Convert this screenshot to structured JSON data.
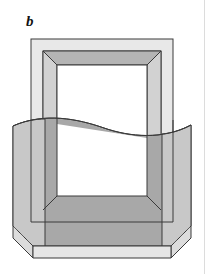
{
  "figure": {
    "panel_label": "b",
    "kind": "technical-line-illustration",
    "caption_text": "",
    "colors": {
      "background": "#ffffff",
      "outline": "#3a3a3a",
      "frame_face_light": "#e8e8e8",
      "frame_bevel_mid": "#d2d2d2",
      "frame_bevel_dark": "#b4b4b4",
      "body_dark": "#a8a8a8",
      "body_side_mid": "#c4c4c4",
      "body_side_light": "#dcdcdc",
      "opening_white": "#ffffff",
      "page_edge_rule": "#dcdcdc",
      "label_color": "#111111"
    },
    "geometry": {
      "outer_frame": {
        "x": 31,
        "y": 39,
        "width": 142,
        "height": 183
      },
      "inner_bevel": {
        "x": 43,
        "y": 51,
        "width": 118,
        "height": 159
      },
      "opening": {
        "x": 57,
        "y": 65,
        "width": 90,
        "height": 131
      },
      "body_left_edge_x": 13,
      "body_right_edge_x": 191,
      "body_bottom_y": 246,
      "chamfer_size": 20,
      "wave_baseline_y": 122,
      "wave_amplitude_px": 9
    },
    "line_styles": {
      "solid_outline_width_px": 1,
      "hidden_edge_style": "dashed",
      "hidden_edge_dash": "5 4"
    },
    "elements": [
      {
        "name": "outer-frame-face",
        "fill": "#e8e8e8"
      },
      {
        "name": "top-bevel-dark",
        "fill": "#b4b4b4"
      },
      {
        "name": "left-bevel",
        "fill": "#d2d2d2"
      },
      {
        "name": "right-bevel",
        "fill": "#d2d2d2"
      },
      {
        "name": "bottom-bevel",
        "fill": "#e2e2e2"
      },
      {
        "name": "extruded-body",
        "fill": "#a8a8a8"
      },
      {
        "name": "body-left-side",
        "fill": "#c4c4c4"
      },
      {
        "name": "body-right-side",
        "fill": "#c4c4c4"
      },
      {
        "name": "bottom-chamfer-left",
        "fill": "#dcdcdc"
      },
      {
        "name": "bottom-chamfer-right",
        "fill": "#dcdcdc"
      },
      {
        "name": "section-wave-curve",
        "stroke": "#3a3a3a"
      },
      {
        "name": "hidden-edge-left",
        "stroke": "#6a6a6a"
      },
      {
        "name": "hidden-edge-right",
        "stroke": "#6a6a6a"
      },
      {
        "name": "inner-opening",
        "fill": "#ffffff"
      }
    ]
  }
}
